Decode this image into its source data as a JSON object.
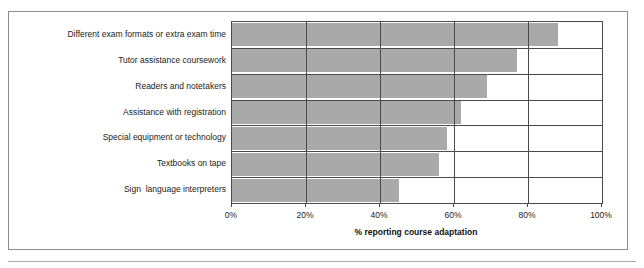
{
  "chart_data": {
    "type": "bar",
    "orientation": "horizontal",
    "title": "",
    "xlabel": "% reporting course adaptation",
    "ylabel": "",
    "xlim": [
      0,
      100
    ],
    "grid": true,
    "legend": "none",
    "bar_color": "#a9a9a9",
    "axis_color": "#4a4a4a",
    "categories": [
      "Different exam formats or extra exam time",
      "Tutor assistance coursework",
      "Readers and notetakers",
      "Assistance with registration",
      "Special equipment or technology",
      "Textbooks on tape",
      "Sign  language interpreters"
    ],
    "values": [
      88,
      77,
      69,
      62,
      58,
      56,
      45
    ],
    "xticks": [
      0,
      20,
      40,
      60,
      80,
      100
    ],
    "xtick_labels": [
      "0%",
      "20%",
      "40%",
      "60%",
      "80%",
      "100%"
    ]
  }
}
